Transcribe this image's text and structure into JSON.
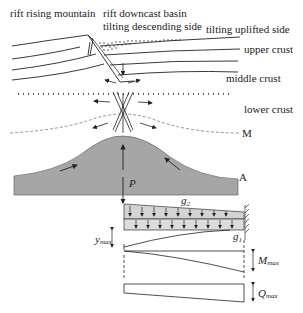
{
  "labels": {
    "rift_rising_mountain": "rift rising mountain",
    "rift_downcast_basin": "rift downcast basin",
    "tilting_descending_side": "tilting descending side",
    "tilting_uplifted_side": "tilting uplifted side",
    "upper_crust": "upper crust",
    "middle_crust": "middle crust",
    "lower_crust": "lower crust",
    "moho": "M",
    "asthenosphere": "A",
    "force": "P",
    "load_g2": "g",
    "load_g2_sub": "2",
    "load_g1": "g",
    "load_g1_sub": "1",
    "deflection": "y",
    "deflection_sub": "max",
    "moment": "M",
    "moment_sub": "max",
    "shear": "Q",
    "shear_sub": "max"
  },
  "colors": {
    "mantle_fill": "#a6a6a6",
    "load_fill": "#d4d4d4",
    "line": "#222222"
  }
}
